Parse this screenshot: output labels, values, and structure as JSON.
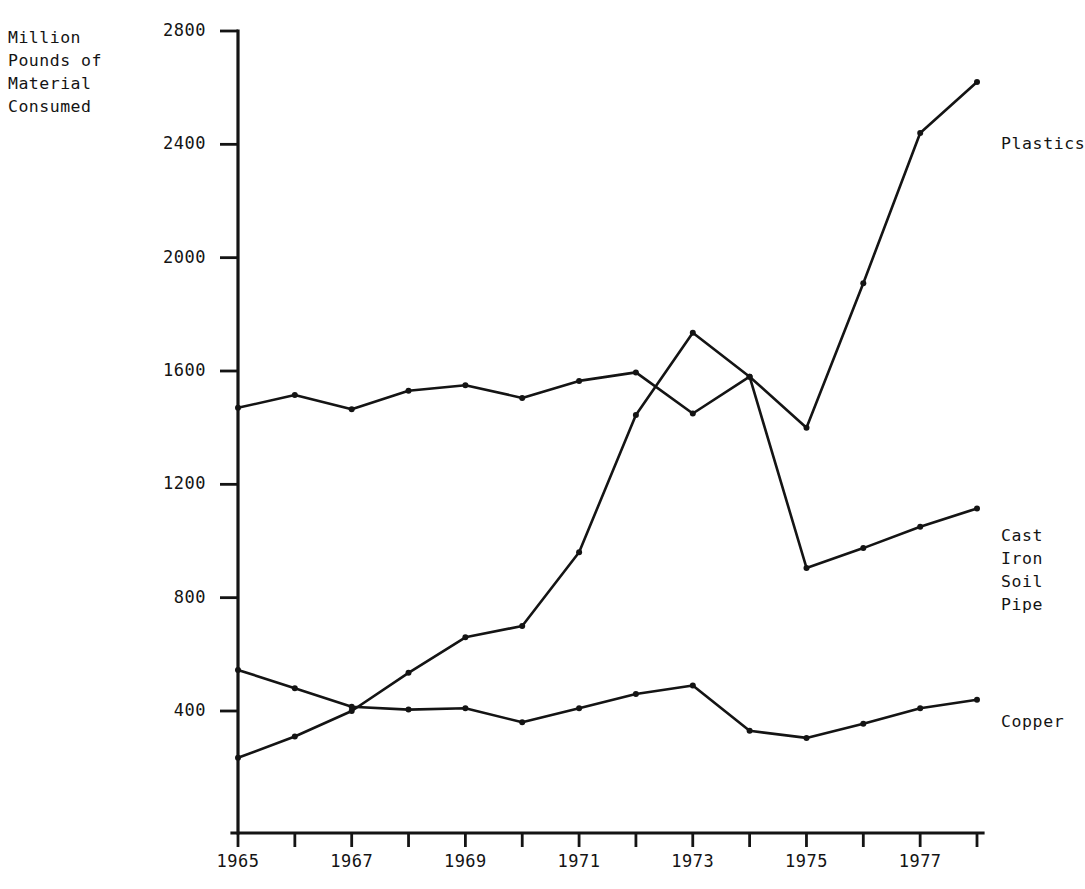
{
  "chart_data": {
    "type": "line",
    "title": "",
    "ylabel": "Million\nPounds of\nMaterial\nConsumed",
    "xlabel": "",
    "x": [
      1965,
      1966,
      1967,
      1968,
      1969,
      1970,
      1971,
      1972,
      1973,
      1974,
      1975,
      1976,
      1977,
      1978
    ],
    "xtick_labels": [
      "1965",
      "1967",
      "1969",
      "1971",
      "1973",
      "1975",
      "1977"
    ],
    "xtick_values": [
      1965,
      1967,
      1969,
      1971,
      1973,
      1975,
      1977
    ],
    "ytick_labels": [
      "2800",
      "2400",
      "2000",
      "1600",
      "1200",
      "800",
      "400"
    ],
    "ytick_values": [
      2800,
      2400,
      2000,
      1600,
      1200,
      800,
      400
    ],
    "xlim": [
      1965,
      1978
    ],
    "ylim": [
      0,
      2800
    ],
    "grid": false,
    "legend_position": "right-inline",
    "series": [
      {
        "name": "Plastics",
        "label": "Plastics",
        "color": "#141414",
        "values": [
          235,
          310,
          400,
          535,
          660,
          700,
          960,
          1445,
          1735,
          1580,
          1400,
          1910,
          2440,
          2620
        ]
      },
      {
        "name": "Cast Iron Soil Pipe",
        "label": "Cast Iron\nSoil Pipe",
        "color": "#141414",
        "values": [
          1470,
          1515,
          1465,
          1530,
          1550,
          1505,
          1565,
          1595,
          1450,
          1580,
          905,
          975,
          1050,
          1115
        ]
      },
      {
        "name": "Copper",
        "label": "Copper",
        "color": "#141414",
        "values": [
          545,
          480,
          415,
          405,
          410,
          360,
          410,
          460,
          490,
          330,
          305,
          355,
          410,
          440
        ]
      }
    ]
  },
  "axis": {
    "y_axis_name": "y-axis",
    "x_axis_name": "x-axis"
  }
}
